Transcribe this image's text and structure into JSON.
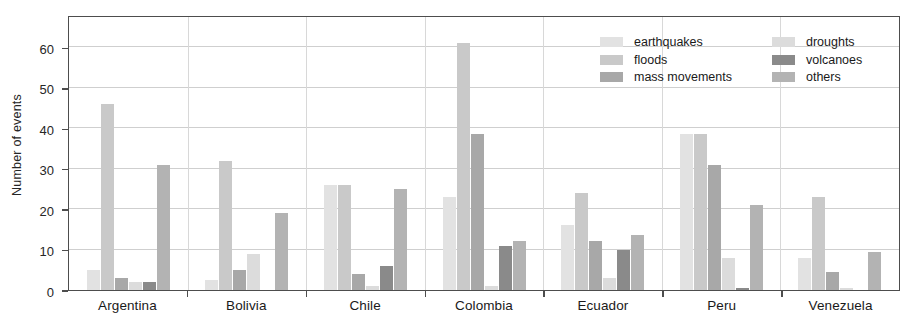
{
  "chart_data": {
    "type": "bar",
    "title": "",
    "subtitle": "",
    "xlabel": "",
    "ylabel": "Number of events",
    "ylim": [
      0,
      68
    ],
    "yticks": [
      0,
      10,
      20,
      30,
      40,
      50,
      60
    ],
    "grid": true,
    "grid_axis": "y",
    "legend_position": "top-right",
    "legend_columns": 2,
    "categories": [
      "Argentina",
      "Bolivia",
      "Chile",
      "Colombia",
      "Ecuador",
      "Peru",
      "Venezuela"
    ],
    "series": [
      {
        "name": "earthquakes",
        "color": "#e2e2e2",
        "values": [
          5,
          2.5,
          26,
          23,
          16,
          38.5,
          8
        ]
      },
      {
        "name": "floods",
        "color": "#c9c9c9",
        "values": [
          46,
          32,
          26,
          61,
          24,
          38.5,
          23
        ]
      },
      {
        "name": "mass movements",
        "color": "#a8a8a8",
        "values": [
          3,
          5,
          4,
          38.5,
          12,
          31,
          4.5
        ]
      },
      {
        "name": "droughts",
        "color": "#dcdcdc",
        "values": [
          2,
          9,
          1,
          1,
          3,
          8,
          0.5
        ]
      },
      {
        "name": "volcanoes",
        "color": "#8a8a8a",
        "values": [
          2,
          0,
          6,
          11,
          10,
          0.5,
          0
        ]
      },
      {
        "name": "others",
        "color": "#b3b3b3",
        "values": [
          31,
          19,
          25,
          12,
          13.5,
          21,
          9.5
        ]
      }
    ]
  },
  "legend": {
    "items": [
      {
        "label": "earthquakes"
      },
      {
        "label": "droughts"
      },
      {
        "label": "floods"
      },
      {
        "label": "volcanoes"
      },
      {
        "label": "mass movements"
      },
      {
        "label": "others"
      }
    ]
  },
  "axis": {
    "y_title": "Number of events"
  }
}
